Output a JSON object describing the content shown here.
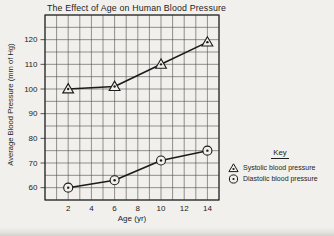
{
  "figure": {
    "title": "The Effect of Age on Human Blood Pressure"
  },
  "chart_data": {
    "type": "line",
    "title": "The Effect of Age on Human Blood Pressure",
    "xlabel": "Age (yr)",
    "ylabel": "Average Blood Pressure (mm of Hg)",
    "x": [
      2,
      6,
      10,
      14
    ],
    "series": [
      {
        "name": "Systolic blood pressure",
        "marker": "triangle",
        "values": [
          100,
          101,
          110,
          119
        ]
      },
      {
        "name": "Diastolic blood pressure",
        "marker": "circle",
        "values": [
          60,
          63,
          71,
          75
        ]
      }
    ],
    "xlim": [
      0,
      15
    ],
    "ylim": [
      55,
      130
    ],
    "x_gridline_step": 1,
    "y_gridline_step": 5,
    "x_tick_labels": [
      "2",
      "4",
      "6",
      "8",
      "10",
      "12",
      "14"
    ],
    "x_tick_values": [
      2,
      4,
      6,
      8,
      10,
      12,
      14
    ],
    "y_tick_labels": [
      "60",
      "70",
      "80",
      "90",
      "100",
      "110",
      "120"
    ],
    "y_tick_values": [
      60,
      70,
      80,
      90,
      100,
      110,
      120
    ],
    "grid": true,
    "legend": {
      "title": "Key",
      "position": "right-bottom",
      "entries": [
        "Systolic blood pressure",
        "Diastolic blood pressure"
      ]
    }
  },
  "colors": {
    "ink": "#1b1b1b",
    "grid": "#4d4d4d",
    "border": "#2a2a2a",
    "background": "#f1f0ec"
  }
}
